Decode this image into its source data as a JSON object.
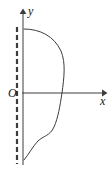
{
  "figure": {
    "type": "math-diagram",
    "background_color": "#ffffff",
    "stroke_color": "#3c3c3c",
    "axis_color": "#3c3c3c",
    "label_color": "#141414",
    "labels": {
      "origin": "O",
      "x_axis": "x",
      "y_axis": "y"
    },
    "axes": {
      "x_axis": {
        "start_x": 22,
        "end_x": 106,
        "y": 93,
        "arrow": "right"
      },
      "y_axis": {
        "x": 23,
        "start_y": 165,
        "end_y": 10,
        "arrow": "up"
      }
    },
    "dashed_line": {
      "x": 17,
      "top_y": 27,
      "bottom_y": 164,
      "dash_pattern": "5 3",
      "stroke_width": 2.2
    },
    "curve": {
      "closed": true,
      "start_point": [
        24,
        29
      ],
      "top_right_max_x": 64,
      "x_axis_crossing_x": 62,
      "end_point": [
        24,
        160
      ],
      "path": "M 24,29 C 40,29 54,36 61,51 C 66,63 64,78 62,93 C 60,106 58,118 54,127 C 50,136 43,136 38,141 C 33,146 29,154 24,160"
    }
  }
}
